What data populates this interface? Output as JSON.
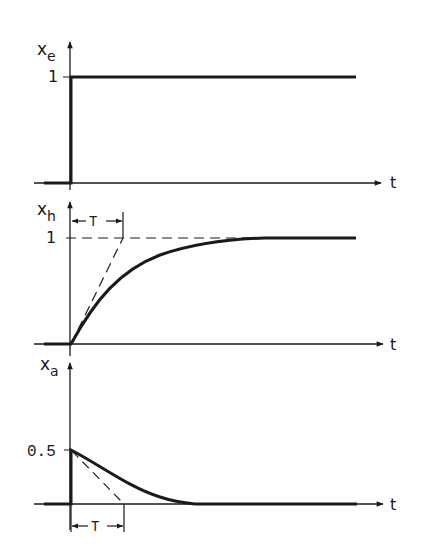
{
  "figure": {
    "time_label": "t",
    "time_constant_label": "T",
    "colors": {
      "ink": "#1a1a1a",
      "background": "#ffffff"
    }
  },
  "panels": [
    {
      "id": "input",
      "y_label_main": "x",
      "y_label_sub": "e",
      "level_label": "1",
      "x_label": "t",
      "curve": "unit step at t=0 rising to 1"
    },
    {
      "id": "lag-response",
      "y_label_main": "x",
      "y_label_sub": "h",
      "level_label": "1",
      "x_label": "t",
      "bracket_label": "T",
      "curve": "1 - exp(-t/T) with dashed tangent at origin reaching 1 at t=T"
    },
    {
      "id": "derivative-response",
      "y_label_main": "x",
      "y_label_sub": "a",
      "level_label": "0.5",
      "x_label": "t",
      "bracket_label": "T",
      "curve": "0.5 * exp(-t/T) with dashed tangent at t=0 reaching 0 at t=T"
    }
  ]
}
